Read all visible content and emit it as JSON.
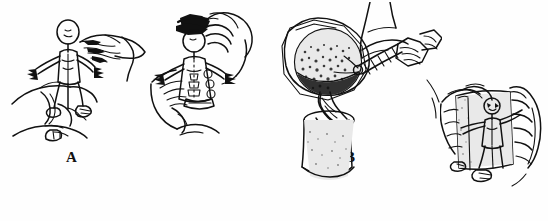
{
  "figure": {
    "kind": "line-art-illustration",
    "style": "black-and-white pen drawing",
    "background_color": "#fefefe",
    "ink_color": "#111111",
    "panel_count": 4,
    "caption_letters": [
      "A",
      "B",
      "C",
      "D"
    ]
  },
  "panels": [
    {
      "id": "a",
      "label": "A",
      "title": "Hands trimming the figurine",
      "description": "Two hands hold a small human figurine upright; the upper hand works at the head and shoulder while the lower hand grips the legs.",
      "icon": "hands-holding-figurine-icon"
    },
    {
      "id": "b",
      "label": "B",
      "title": "Hands capping the figurine head",
      "description": "The figurine is held in one hand while the other hand fits a dark cap or sprue onto its head.",
      "icon": "hands-capping-figurine-icon"
    },
    {
      "id": "c",
      "label": "C",
      "title": "Pouring from a crucible into a cup",
      "description": "A gloved hand uses tongs to tip a round crucible, pouring a speckled stream into a cylindrical cup below.",
      "icon": "pouring-crucible-icon"
    },
    {
      "id": "d",
      "label": "D",
      "title": "Hands holding the mould block",
      "description": "Two hands hold a rectangular block that contains the figurine embedded inside it.",
      "icon": "hands-holding-mould-icon"
    }
  ]
}
